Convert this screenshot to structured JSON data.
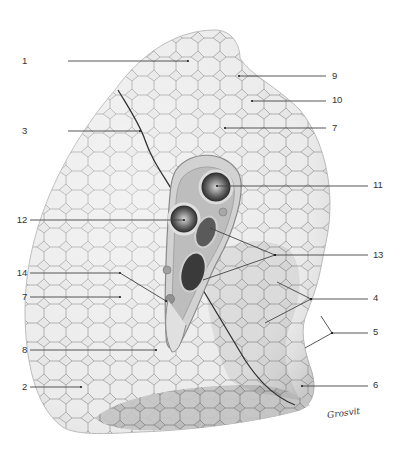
{
  "figure": {
    "type": "anatomical-illustration",
    "colors": {
      "background": "#ffffff",
      "tissue_light": "#e4e4e4",
      "tissue_mid": "#c8c8c8",
      "tissue_dark": "#8a8a8a",
      "leader_line": "#444444",
      "label_text": "#333333"
    }
  },
  "labels": [
    {
      "id": "1",
      "side": "left",
      "text": "1",
      "tx": 5,
      "ty": 56,
      "lines": [
        [
          68,
          61,
          188,
          61
        ]
      ]
    },
    {
      "id": "3",
      "side": "left",
      "text": "3",
      "tx": 5,
      "ty": 126,
      "lines": [
        [
          68,
          131,
          140,
          131
        ]
      ]
    },
    {
      "id": "12",
      "side": "left",
      "text": "12",
      "tx": 5,
      "ty": 215,
      "lines": [
        [
          30,
          220,
          184,
          220
        ]
      ]
    },
    {
      "id": "14",
      "side": "left",
      "text": "14",
      "tx": 5,
      "ty": 268,
      "lines": [
        [
          30,
          273,
          120,
          273
        ],
        [
          120,
          273,
          166,
          301
        ]
      ]
    },
    {
      "id": "7b",
      "side": "left",
      "text": "7",
      "tx": 5,
      "ty": 292,
      "lines": [
        [
          30,
          297,
          120,
          297
        ]
      ]
    },
    {
      "id": "8",
      "side": "left",
      "text": "8",
      "tx": 5,
      "ty": 345,
      "lines": [
        [
          30,
          350,
          156,
          350
        ]
      ]
    },
    {
      "id": "2",
      "side": "left",
      "text": "2",
      "tx": 5,
      "ty": 382,
      "lines": [
        [
          30,
          387,
          81,
          387
        ]
      ]
    },
    {
      "id": "9",
      "side": "right",
      "text": "9",
      "tx": 332,
      "ty": 71,
      "lines": [
        [
          239,
          76,
          326,
          76
        ]
      ]
    },
    {
      "id": "10",
      "side": "right",
      "text": "10",
      "tx": 332,
      "ty": 95,
      "lines": [
        [
          252,
          101,
          326,
          101
        ]
      ]
    },
    {
      "id": "7a",
      "side": "right",
      "text": "7",
      "tx": 332,
      "ty": 123,
      "lines": [
        [
          225,
          128,
          326,
          128
        ]
      ]
    },
    {
      "id": "11",
      "side": "right",
      "text": "11",
      "tx": 373,
      "ty": 180,
      "lines": [
        [
          217,
          186,
          368,
          186
        ]
      ]
    },
    {
      "id": "13",
      "side": "right",
      "text": "13",
      "tx": 373,
      "ty": 250,
      "lines": [
        [
          275,
          255,
          368,
          255
        ],
        [
          275,
          255,
          210,
          228
        ],
        [
          275,
          255,
          203,
          280
        ]
      ]
    },
    {
      "id": "4",
      "side": "right",
      "text": "4",
      "tx": 373,
      "ty": 293,
      "lines": [
        [
          311,
          299,
          368,
          299
        ],
        [
          311,
          299,
          277,
          282
        ],
        [
          311,
          299,
          265,
          323
        ]
      ]
    },
    {
      "id": "5",
      "side": "right",
      "text": "5",
      "tx": 373,
      "ty": 327,
      "lines": [
        [
          332,
          333,
          368,
          333
        ],
        [
          332,
          333,
          321,
          316
        ],
        [
          332,
          333,
          305,
          348
        ]
      ]
    },
    {
      "id": "6",
      "side": "right",
      "text": "6",
      "tx": 373,
      "ty": 380,
      "lines": [
        [
          302,
          386,
          368,
          386
        ]
      ]
    }
  ],
  "signature": {
    "text": "Grosvit"
  }
}
